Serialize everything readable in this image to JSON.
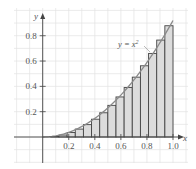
{
  "chart_data": {
    "type": "bar",
    "title": "",
    "subtitle": "",
    "xlabel": "x",
    "ylabel": "y",
    "xlim": [
      0,
      1.0
    ],
    "ylim": [
      0,
      1.0
    ],
    "grid": true,
    "legend": "none",
    "curve": {
      "label": "y = x²",
      "function": "x^2"
    },
    "bar_method": "left endpoints",
    "n_subintervals": 16,
    "categories": [
      "0",
      "0.0625",
      "0.125",
      "0.1875",
      "0.25",
      "0.3125",
      "0.375",
      "0.4375",
      "0.5",
      "0.5625",
      "0.625",
      "0.6875",
      "0.75",
      "0.8125",
      "0.875",
      "0.9375"
    ],
    "values": [
      0,
      0.0039,
      0.0156,
      0.0352,
      0.0625,
      0.0977,
      0.1406,
      0.1914,
      0.25,
      0.3164,
      0.3906,
      0.4727,
      0.5625,
      0.6602,
      0.7656,
      0.8789
    ],
    "x_ticks": [
      "0.2",
      "0.4",
      "0.6",
      "0.8",
      "1.0"
    ],
    "y_ticks": [
      "0.2",
      "0.4",
      "0.6",
      "0.8"
    ],
    "annotations": [
      "y = x²"
    ]
  },
  "labels": {
    "x_axis": "x",
    "y_axis": "y",
    "curve": "y = x",
    "curve_exp": "2"
  },
  "colors": {
    "bar_fill": "#dcdcdc",
    "bar_stroke": "#444444",
    "curve": "#8a8a8a",
    "grid": "#e2e2e2",
    "axis": "#444444"
  }
}
